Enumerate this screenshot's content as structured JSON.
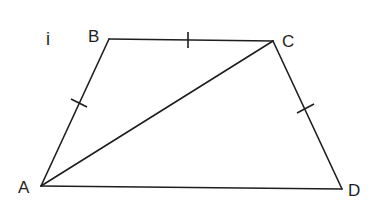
{
  "figure": {
    "part_label": "i",
    "stroke_color": "#1e1e1e",
    "background": "#ffffff",
    "vertices": [
      {
        "name": "A",
        "x": 41,
        "y": 186,
        "label_x": 18,
        "label_y": 193
      },
      {
        "name": "B",
        "x": 109,
        "y": 39,
        "label_x": 88,
        "label_y": 42
      },
      {
        "name": "C",
        "x": 273,
        "y": 41,
        "label_x": 282,
        "label_y": 47
      },
      {
        "name": "D",
        "x": 342,
        "y": 189,
        "label_x": 348,
        "label_y": 196
      }
    ],
    "segments": [
      {
        "from": "A",
        "to": "B",
        "tick_marks": 1
      },
      {
        "from": "B",
        "to": "C",
        "tick_marks": 1
      },
      {
        "from": "C",
        "to": "D",
        "tick_marks": 1
      },
      {
        "from": "A",
        "to": "D",
        "tick_marks": 0
      },
      {
        "from": "A",
        "to": "C",
        "tick_marks": 0,
        "role": "diagonal"
      }
    ],
    "shape": "trapezium ABCD with AB = BC = CD and diagonal AC"
  }
}
